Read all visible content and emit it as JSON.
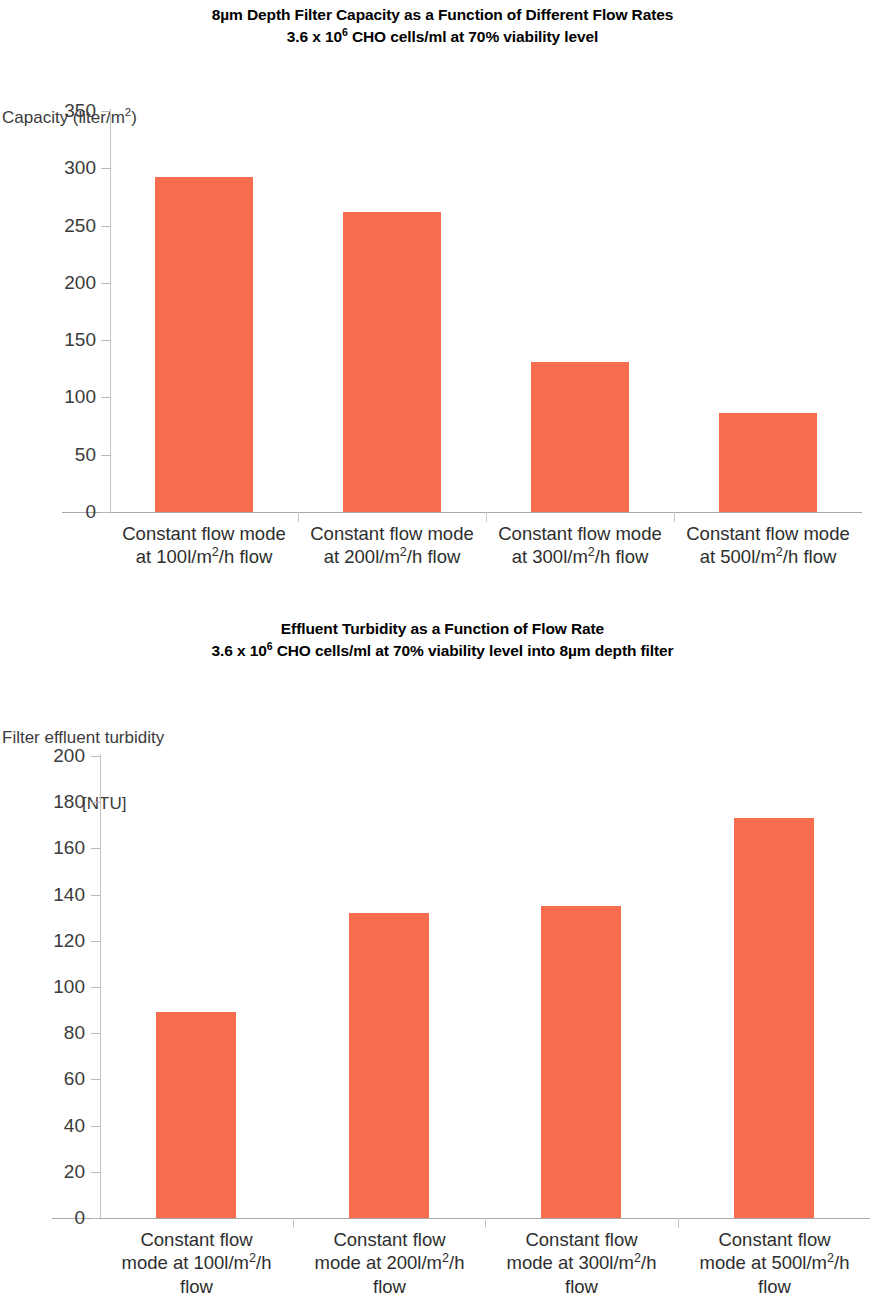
{
  "figure": {
    "charts": [
      {
        "id": "capacity-chart",
        "title_line1": "8µm Depth Filter Capacity as a Function of Different Flow Rates",
        "title_line2_a": "3.6 x 10",
        "title_line2_sup": "6",
        "title_line2_b": " CHO cells/ml at 70% viability level",
        "ylabel_line1": "Capacity (liter/m",
        "ylabel_sup": "2",
        "ylabel_line1_end": ")",
        "ylabel_line2": ""
      },
      {
        "id": "turbidity-chart",
        "title_line1": "Effluent Turbidity as a Function of Flow Rate",
        "title_line2_a": "3.6 x 10",
        "title_line2_sup": "6",
        "title_line2_b": " CHO cells/ml at 70% viability level into 8µm depth filter",
        "ylabel_line1": "Filter effluent turbidity",
        "ylabel_line2": "[NTU]"
      }
    ]
  },
  "chart_data": [
    {
      "type": "bar",
      "id": "capacity-chart",
      "title": "8µm Depth Filter Capacity as a Function of Different Flow Rates\n3.6 x 10^6 CHO cells/ml at 70% viability level",
      "ylabel": "Capacity (liter/m2)",
      "xlabel": "",
      "categories": [
        "Constant flow mode at 100l/m2/h flow",
        "Constant flow mode at 200l/m2/h flow",
        "Constant flow mode at 300l/m2/h flow",
        "Constant flow mode at 500l/m2/h flow"
      ],
      "category_lines": [
        [
          "Constant flow mode",
          "at 100l/m",
          "/h flow"
        ],
        [
          "Constant flow mode",
          "at 200l/m",
          "/h flow"
        ],
        [
          "Constant flow mode",
          "at 300l/m",
          "/h flow"
        ],
        [
          "Constant flow mode",
          "at 500l/m",
          "/h flow"
        ]
      ],
      "values": [
        292,
        262,
        131,
        86
      ],
      "ylim": [
        0,
        350
      ],
      "yticks": [
        0,
        50,
        100,
        150,
        200,
        250,
        300,
        350
      ],
      "grid": false,
      "legend": "none",
      "bar_color": "#f96d4f"
    },
    {
      "type": "bar",
      "id": "turbidity-chart",
      "title": "Effluent Turbidity as a Function of Flow Rate\n3.6 x 10^6 CHO cells/ml at 70% viability level into 8µm depth filter",
      "ylabel": "Filter effluent turbidity [NTU]",
      "xlabel": "",
      "categories": [
        "Constant flow mode at 100l/m2/h flow",
        "Constant flow mode at 200l/m2/h flow",
        "Constant flow mode at 300l/m2/h flow",
        "Constant flow mode at 500l/m2/h flow"
      ],
      "category_lines": [
        [
          "Constant flow",
          "mode at 100l/m",
          "/h",
          "flow"
        ],
        [
          "Constant flow",
          "mode at 200l/m",
          "/h",
          "flow"
        ],
        [
          "Constant flow",
          "mode at 300l/m",
          "/h",
          "flow"
        ],
        [
          "Constant flow",
          "mode at 500l/m",
          "/h",
          "flow"
        ]
      ],
      "values": [
        89,
        132,
        135,
        173
      ],
      "ylim": [
        0,
        200
      ],
      "yticks": [
        0,
        20,
        40,
        60,
        80,
        100,
        120,
        140,
        160,
        180,
        200
      ],
      "grid": false,
      "legend": "none",
      "bar_color": "#f96d4f"
    }
  ]
}
